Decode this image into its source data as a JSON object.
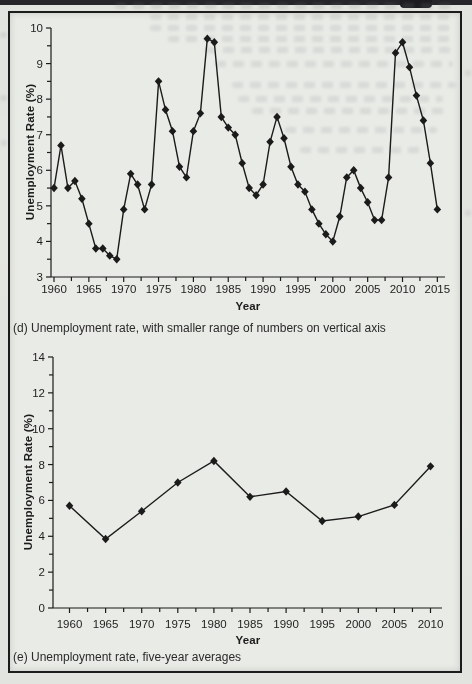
{
  "page": {
    "type": "scanned textbook figure",
    "paper_color": "#e9ebe6",
    "margin_color": "#e2e4df",
    "ink_color": "#1b1b1b",
    "caption_color": "#2b2b2b"
  },
  "chart_data": [
    {
      "type": "line",
      "title": "(d) Unemployment rate, with smaller range of numbers on vertical axis",
      "xlabel": "Year",
      "ylabel": "Unemployment Rate (%)",
      "ylim": [
        3,
        10
      ],
      "xlim": [
        1960,
        2016
      ],
      "yticks": [
        3,
        4,
        5,
        6,
        7,
        8,
        9,
        10
      ],
      "xticks": [
        1960,
        1965,
        1970,
        1975,
        1980,
        1985,
        1990,
        1995,
        2000,
        2005,
        2010,
        2015
      ],
      "grid": false,
      "legend": "none",
      "marker": "diamond",
      "line_color": "#1b1b1b",
      "x": [
        1960,
        1961,
        1962,
        1963,
        1964,
        1965,
        1966,
        1967,
        1968,
        1969,
        1970,
        1971,
        1972,
        1973,
        1974,
        1975,
        1976,
        1977,
        1978,
        1979,
        1980,
        1981,
        1982,
        1983,
        1984,
        1985,
        1986,
        1987,
        1988,
        1989,
        1990,
        1991,
        1992,
        1993,
        1994,
        1995,
        1996,
        1997,
        1998,
        1999,
        2000,
        2001,
        2002,
        2003,
        2004,
        2005,
        2006,
        2007,
        2008,
        2009,
        2010,
        2011,
        2012,
        2013,
        2014,
        2015
      ],
      "values": [
        5.5,
        6.7,
        5.5,
        5.7,
        5.2,
        4.5,
        3.8,
        3.8,
        3.6,
        3.5,
        4.9,
        5.9,
        5.6,
        4.9,
        5.6,
        8.5,
        7.7,
        7.1,
        6.1,
        5.8,
        7.1,
        7.6,
        9.7,
        9.6,
        7.5,
        7.2,
        7.0,
        6.2,
        5.5,
        5.3,
        5.6,
        6.8,
        7.5,
        6.9,
        6.1,
        5.6,
        5.4,
        4.9,
        4.5,
        4.2,
        4.0,
        4.7,
        5.8,
        6.0,
        5.5,
        5.1,
        4.6,
        4.6,
        5.8,
        9.3,
        9.6,
        8.9,
        8.1,
        7.4,
        6.2,
        4.9
      ]
    },
    {
      "type": "line",
      "title": "(e) Unemployment rate, five-year averages",
      "xlabel": "Year",
      "ylabel": "Unemployment Rate (%)",
      "ylim": [
        0,
        14
      ],
      "xlim": [
        1960,
        2012
      ],
      "yticks": [
        0,
        2,
        4,
        6,
        8,
        10,
        12,
        14
      ],
      "xticks": [
        1960,
        1965,
        1970,
        1975,
        1980,
        1985,
        1990,
        1995,
        2000,
        2005,
        2010
      ],
      "grid": false,
      "legend": "none",
      "marker": "diamond",
      "line_color": "#1b1b1b",
      "x": [
        1960,
        1965,
        1970,
        1975,
        1980,
        1985,
        1990,
        1995,
        2000,
        2005,
        2010
      ],
      "values": [
        5.7,
        3.85,
        5.4,
        7.0,
        8.2,
        6.2,
        6.5,
        4.85,
        5.1,
        5.75,
        7.9
      ]
    }
  ]
}
